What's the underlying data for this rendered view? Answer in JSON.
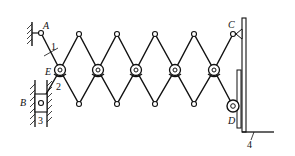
{
  "figure": {
    "type": "scissor-lift mechanism kinematic diagram",
    "labels": {
      "A": "A",
      "B": "B",
      "C": "C",
      "D": "D",
      "E": "E"
    },
    "part_numbers": {
      "p1": "1",
      "p2": "2",
      "p3": "3",
      "p4": "4"
    },
    "line_color": "#111111",
    "background": "#ffffff"
  }
}
